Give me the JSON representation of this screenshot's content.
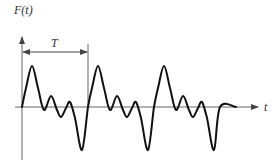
{
  "diagram": {
    "y_axis_label": "F(t)",
    "x_axis_label": "t",
    "period_label": "T",
    "colors": {
      "axis": "#666666",
      "curve": "#111111",
      "text": "#333333"
    }
  }
}
